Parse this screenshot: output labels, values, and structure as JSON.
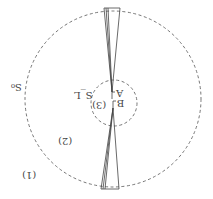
{
  "diagram": {
    "orientation": "rotated-180",
    "outer_circle": {
      "label": "S₀",
      "style": "dashed"
    },
    "inner_circle": {
      "label": "S_L",
      "style": "dashed"
    },
    "regions": [
      {
        "label": "(1)"
      },
      {
        "label": "(2)"
      },
      {
        "label": "(3)"
      }
    ],
    "points": [
      {
        "label": "A"
      },
      {
        "label": "B"
      }
    ],
    "colors": {
      "line": "#555555",
      "background": "#ffffff"
    }
  }
}
